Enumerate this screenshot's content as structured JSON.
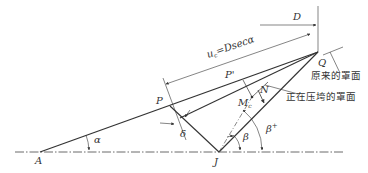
{
  "diagram": {
    "points": {
      "A": "A",
      "P": "P",
      "P_prime": "P'",
      "Q": "Q",
      "J": "J",
      "N": "N",
      "M": "M"
    },
    "labels": {
      "D": "D",
      "u_eq": "u",
      "u_sub": "c",
      "u_rest": "=Dsecα",
      "alpha": "α",
      "beta": "β",
      "beta_plus": "β",
      "beta_plus_sup": "+",
      "delta": "δ",
      "M_sub": "c"
    },
    "annotations": {
      "original_mask": "原来的罩面",
      "collapsing_mask": "正在压垮的罩面"
    },
    "colors": {
      "line": "#333333",
      "background": "#ffffff"
    }
  }
}
